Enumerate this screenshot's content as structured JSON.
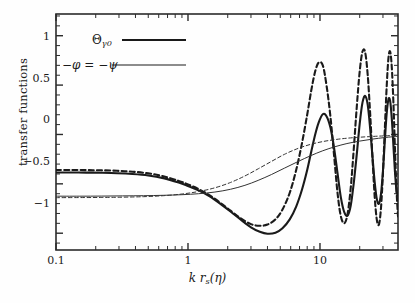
{
  "chart_data": {
    "type": "line",
    "title": "",
    "xlabel": "k r_s(eta)",
    "ylabel": "transfer functions",
    "xscale": "log",
    "xlim": [
      0.1,
      39.0
    ],
    "ylim": [
      -1.17,
      1.22
    ],
    "xticks": [
      0.1,
      1,
      10
    ],
    "xticklabels": [
      "0.1",
      "1",
      "10"
    ],
    "yticks": [
      1,
      0.5,
      0,
      -0.5,
      -1
    ],
    "yticklabels": [
      "1",
      "0.5",
      "0",
      "−0.5",
      "−1"
    ],
    "grid": false,
    "legend_position": "upper-left-inside",
    "series": [
      {
        "name": "Theta_gamma0 (solid)",
        "style": "solid",
        "width": 2.1,
        "color": "#1a1a1a",
        "plateau": -0.385,
        "first_min": -1.01,
        "x": [
          0.1,
          0.13,
          0.17,
          0.22,
          0.29,
          0.38,
          0.5,
          0.65,
          0.85,
          1.0,
          1.2,
          1.45,
          1.75,
          2.1,
          2.5,
          3.0,
          3.5,
          4.0,
          4.6,
          5.2,
          5.9,
          6.6,
          7.3,
          8.0,
          8.6,
          9.2,
          9.8,
          10.5,
          11.2,
          12.0,
          12.8,
          13.6,
          14.4,
          15.3,
          16.2,
          17.1,
          18.0,
          19.0,
          20.0,
          21.0,
          22.0,
          23.0,
          24.0,
          25.0,
          26.0,
          27.0,
          28.0,
          29.0,
          30.0,
          31.0,
          32.0,
          33.0,
          34.0,
          35.0,
          36.0,
          37.0,
          38.0,
          39.0
        ],
        "y": [
          -0.385,
          -0.385,
          -0.386,
          -0.388,
          -0.392,
          -0.4,
          -0.415,
          -0.442,
          -0.487,
          -0.522,
          -0.566,
          -0.624,
          -0.7,
          -0.78,
          -0.86,
          -0.94,
          -0.985,
          -1.005,
          -0.995,
          -0.95,
          -0.86,
          -0.73,
          -0.56,
          -0.36,
          -0.17,
          0.0,
          0.125,
          0.205,
          0.185,
          0.07,
          -0.14,
          -0.4,
          -0.64,
          -0.79,
          -0.82,
          -0.72,
          -0.5,
          -0.2,
          0.11,
          0.325,
          0.39,
          0.3,
          0.06,
          -0.23,
          -0.49,
          -0.66,
          -0.7,
          -0.6,
          -0.37,
          -0.06,
          0.21,
          0.355,
          0.34,
          0.16,
          -0.11,
          -0.38,
          -0.57,
          -0.62
        ]
      },
      {
        "name": "Theta_gamma0 (dashed)",
        "style": "dashed",
        "width": 2.1,
        "color": "#1a1a1a",
        "plateau": -0.36,
        "first_min": -0.92,
        "x": [
          0.1,
          0.13,
          0.17,
          0.22,
          0.29,
          0.38,
          0.5,
          0.65,
          0.85,
          1.0,
          1.2,
          1.45,
          1.75,
          2.1,
          2.5,
          3.0,
          3.5,
          4.0,
          4.6,
          5.2,
          5.9,
          6.6,
          7.3,
          8.0,
          8.6,
          9.2,
          9.8,
          10.5,
          11.2,
          12.0,
          12.8,
          13.6,
          14.4,
          15.3,
          16.2,
          17.1,
          18.0,
          19.0,
          20.0,
          21.0,
          22.0,
          23.0,
          24.0,
          25.0,
          26.0,
          27.0,
          28.0,
          29.0,
          30.0,
          31.0,
          32.0,
          33.0,
          34.0,
          35.0,
          36.0,
          37.0,
          38.0,
          39.0
        ],
        "y": [
          -0.36,
          -0.36,
          -0.361,
          -0.363,
          -0.368,
          -0.377,
          -0.394,
          -0.423,
          -0.47,
          -0.506,
          -0.552,
          -0.614,
          -0.69,
          -0.772,
          -0.848,
          -0.908,
          -0.925,
          -0.912,
          -0.86,
          -0.76,
          -0.59,
          -0.36,
          -0.09,
          0.2,
          0.45,
          0.64,
          0.73,
          0.7,
          0.5,
          0.18,
          -0.22,
          -0.6,
          -0.83,
          -0.9,
          -0.8,
          -0.54,
          -0.16,
          0.28,
          0.64,
          0.84,
          0.83,
          0.6,
          0.21,
          -0.24,
          -0.64,
          -0.87,
          -0.91,
          -0.74,
          -0.39,
          0.06,
          0.48,
          0.77,
          0.84,
          0.68,
          0.32,
          -0.15,
          -0.56,
          -0.83
        ]
      },
      {
        "name": "-phi = -psi (solid)",
        "style": "solid",
        "width": 1.0,
        "color": "#333333",
        "plateau": -0.625,
        "x": [
          0.1,
          0.15,
          0.22,
          0.32,
          0.46,
          0.65,
          0.9,
          1.2,
          1.6,
          2.1,
          2.7,
          3.4,
          4.3,
          5.4,
          6.8,
          8.5,
          10.5,
          13.0,
          16.0,
          20.0,
          25.0,
          31.0,
          39.0
        ],
        "y": [
          -0.625,
          -0.625,
          -0.624,
          -0.622,
          -0.62,
          -0.616,
          -0.61,
          -0.6,
          -0.583,
          -0.555,
          -0.515,
          -0.465,
          -0.405,
          -0.34,
          -0.275,
          -0.215,
          -0.165,
          -0.124,
          -0.092,
          -0.067,
          -0.047,
          -0.031,
          -0.018
        ]
      },
      {
        "name": "-phi = -psi (dashed)",
        "style": "dashed",
        "width": 1.0,
        "color": "#333333",
        "plateau": -0.64,
        "x": [
          0.1,
          0.15,
          0.22,
          0.32,
          0.46,
          0.65,
          0.9,
          1.2,
          1.6,
          2.1,
          2.7,
          3.4,
          4.3,
          5.4,
          6.8,
          8.5,
          10.5,
          13.0,
          16.0,
          20.0,
          25.0,
          31.0,
          39.0
        ],
        "y": [
          -0.64,
          -0.639,
          -0.638,
          -0.635,
          -0.63,
          -0.62,
          -0.603,
          -0.578,
          -0.54,
          -0.486,
          -0.42,
          -0.348,
          -0.272,
          -0.2,
          -0.142,
          -0.1,
          -0.072,
          -0.052,
          -0.038,
          -0.028,
          -0.02,
          -0.014,
          -0.009
        ]
      }
    ],
    "legend": [
      {
        "label": "Θγ0",
        "key": "theta-gamma0",
        "style": "solid",
        "width": 2.1
      },
      {
        "label": "−φ = −ψ",
        "key": "minus-phi-equals-minus-psi",
        "style": "solid",
        "width": 1.0
      }
    ]
  },
  "axes": {
    "ylabel": "transfer functions",
    "xlabel_parts": {
      "k": "k",
      "r": "r",
      "s": "s",
      "eta": "(η)"
    },
    "ytick_labels": [
      "1",
      "0.5",
      "0",
      "−0.5",
      "−1"
    ],
    "xtick_labels": [
      "0.1",
      "1",
      "10"
    ]
  },
  "legend_labels": {
    "theta": "Θ",
    "theta_sub": "γ0",
    "phi_psi": "−φ = −ψ"
  },
  "colors": {
    "frame": "#2b2b2b",
    "thick_curve": "#1a1a1a",
    "thin_curve": "#333333",
    "background": "#fefefe"
  }
}
